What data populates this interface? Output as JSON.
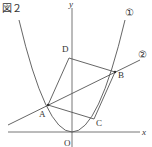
{
  "figure": {
    "title": "図２",
    "axes": {
      "x_label": "x",
      "y_label": "y",
      "origin_label": "O"
    },
    "curves": [
      {
        "id": "1",
        "label": "①",
        "type": "parabola"
      },
      {
        "id": "2",
        "label": "②",
        "type": "line"
      }
    ],
    "points": {
      "A": "A",
      "B": "B",
      "C": "C",
      "D": "D"
    },
    "color": "#555555"
  }
}
